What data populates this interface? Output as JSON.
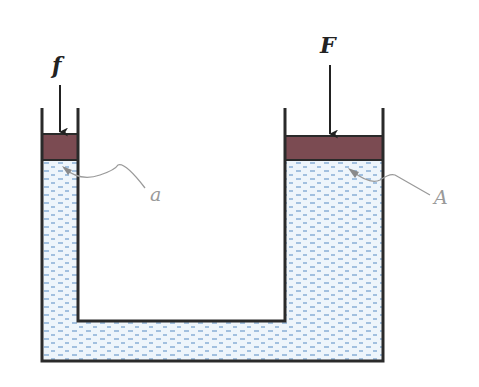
{
  "diagram": {
    "labels": {
      "small_force": "f",
      "large_force": "F",
      "small_area": "a",
      "large_area": "A"
    },
    "colors": {
      "outline": "#2a2a2a",
      "piston": "#7b4b52",
      "liquid": "#eef5fb",
      "liquid_dash": "#6f9ccc",
      "leader": "#9a9a9a"
    },
    "components": [
      {
        "name": "small-piston",
        "area_label": "a",
        "force_label": "f"
      },
      {
        "name": "large-piston",
        "area_label": "A",
        "force_label": "F"
      },
      {
        "name": "connecting-channel",
        "content": "liquid"
      }
    ]
  }
}
